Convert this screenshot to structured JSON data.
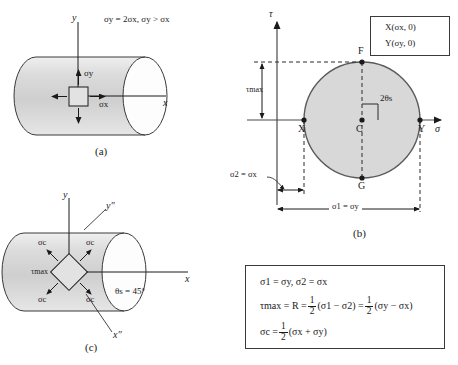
{
  "figure_a": {
    "caption": "(a)",
    "condition_text": "σy = 2σx, σy > σx",
    "axis_y": "y",
    "axis_x": "x",
    "stress_up": "σy",
    "stress_right": "σx"
  },
  "figure_b": {
    "caption": "(b)",
    "axis_tau": "τ",
    "axis_sigma": "σ",
    "point_x": "X",
    "point_y": "Y",
    "point_c": "C",
    "point_f": "F",
    "point_g": "G",
    "angle_label": "2θs",
    "tau_max_label": "τmax",
    "dim_sigma2": "σ2 = σx",
    "dim_sigma1": "σ1 = σy",
    "legend": {
      "line1": "X(σx, 0)",
      "line2": "Y(σy, 0)"
    }
  },
  "figure_c": {
    "caption": "(c)",
    "axis_y": "y",
    "axis_x": "x",
    "axis_y_double_prime": "y″",
    "axis_x_double_prime": "x″",
    "angle_label": "θs = 45°",
    "tau_max_label": "τmax",
    "sigma_c_tl": "σc",
    "sigma_c_tr": "σc",
    "sigma_c_bl": "σc",
    "sigma_c_br": "σc"
  },
  "equations": {
    "line1": "σ1 = σy, σ2 = σx",
    "line2_lhs": "τmax = R =",
    "line2_mid": "(σ1 − σ2) =",
    "line2_rhs": "(σy − σx)",
    "line3_lhs": "σc =",
    "line3_rhs": "(σx + σy)",
    "frac_num": "1",
    "frac_den": "2"
  },
  "colors": {
    "cylinder_fill": "#d2d2d2",
    "cylinder_light": "#efefef",
    "circle_fill": "#d8d8d8",
    "stroke": "#3a3a3a",
    "text": "#1a1a1a"
  }
}
